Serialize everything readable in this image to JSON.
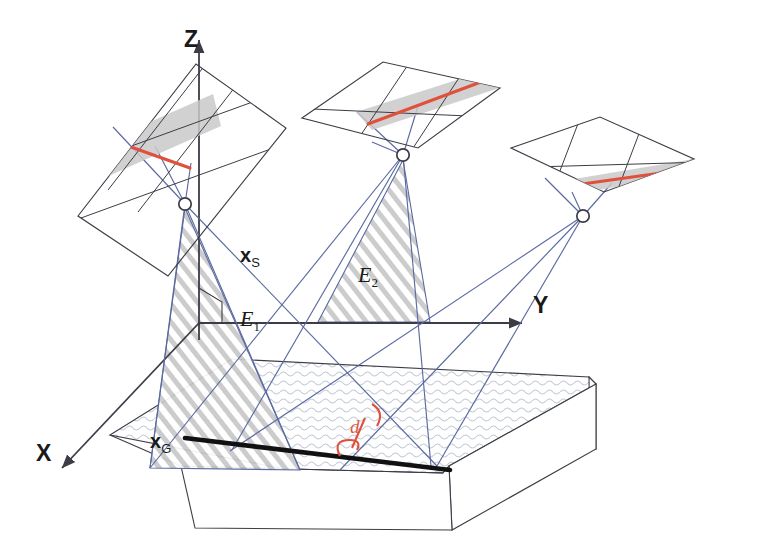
{
  "figure": {
    "background_color": "#ffffff"
  },
  "colors": {
    "line_dark": "#3c3c46",
    "line_blue": "#5b6aa0",
    "red": "#e0503c",
    "gray_band": "#c9c9c9",
    "hatch_gray": "#c0c0c0",
    "black": "#111111",
    "ground_stipple": "#c3cbd8"
  },
  "axes": {
    "x": {
      "label": "X",
      "label_x": 36,
      "label_y": 440
    },
    "y": {
      "label": "Y",
      "label_x": 533,
      "label_y": 292
    },
    "z": {
      "label": "Z",
      "label_x": 184,
      "label_y": 26
    }
  },
  "points": [
    {
      "name": "scene-point-s",
      "label": "x",
      "sub": "S",
      "label_x": 240,
      "label_y": 244
    },
    {
      "name": "ground-point-g",
      "label": "x",
      "sub": "G",
      "label_x": 150,
      "label_y": 430
    }
  ],
  "planes": [
    {
      "name": "epipolar-plane-1",
      "label": "E",
      "sub": "1",
      "label_x": 240,
      "label_y": 306
    },
    {
      "name": "epipolar-plane-2",
      "label": "E",
      "sub": "2",
      "label_x": 358,
      "label_y": 262
    }
  ],
  "measurements": [
    {
      "name": "distance-d",
      "label": "d",
      "label_x": 350,
      "label_y": 416
    }
  ],
  "cameras": [
    {
      "name": "camera-center-1",
      "cx": 185,
      "cy": 204,
      "r": 6
    },
    {
      "name": "camera-center-2",
      "cx": 403,
      "cy": 155,
      "r": 6
    },
    {
      "name": "camera-center-3",
      "cx": 583,
      "cy": 216,
      "r": 6
    }
  ],
  "image_planes": [
    {
      "name": "image-plane-left",
      "orientation": "tilted-vertical"
    },
    {
      "name": "image-plane-middle",
      "orientation": "horizontal"
    },
    {
      "name": "image-plane-right",
      "orientation": "horizontal"
    }
  ],
  "ground": {
    "name": "ground-block",
    "texture": "stipple",
    "edge_line": "thick-black"
  }
}
